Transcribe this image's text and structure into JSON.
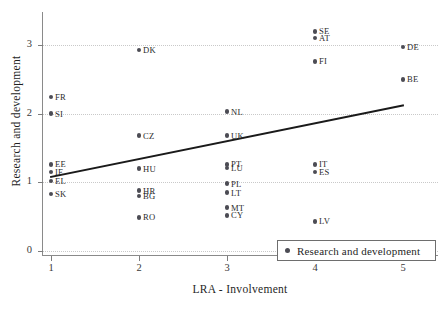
{
  "chart_data": {
    "type": "scatter",
    "title": "",
    "xlabel": "LRA - Involvement",
    "ylabel": "Research and development",
    "xlim": [
      0.5,
      5.5
    ],
    "ylim": [
      -0.1,
      3.35
    ],
    "xticks": [
      "1",
      "2",
      "3",
      "4",
      "5"
    ],
    "xtick_values": [
      1,
      2,
      3,
      4,
      5
    ],
    "yticks": [
      "0",
      "1",
      "2",
      "3"
    ],
    "ytick_values": [
      0,
      1,
      2,
      3
    ],
    "grid": "horizontal-dotted",
    "legend_position": "bottom-right",
    "series": [
      {
        "name": "Research and development",
        "marker": "circle",
        "color": "#4c4c54",
        "points": [
          {
            "label": "SE",
            "x": 4,
            "y": 3.2
          },
          {
            "label": "AT",
            "x": 4,
            "y": 3.1
          },
          {
            "label": "DE",
            "x": 5,
            "y": 2.97
          },
          {
            "label": "DK",
            "x": 2,
            "y": 2.93
          },
          {
            "label": "FI",
            "x": 4,
            "y": 2.76
          },
          {
            "label": "BE",
            "x": 5,
            "y": 2.5
          },
          {
            "label": "FR",
            "x": 1,
            "y": 2.24
          },
          {
            "label": "NL",
            "x": 3,
            "y": 2.03
          },
          {
            "label": "SI",
            "x": 1,
            "y": 2.0
          },
          {
            "label": "CZ",
            "x": 2,
            "y": 1.68
          },
          {
            "label": "UK",
            "x": 3,
            "y": 1.68
          },
          {
            "label": "EE",
            "x": 1,
            "y": 1.26
          },
          {
            "label": "PT",
            "x": 3,
            "y": 1.26
          },
          {
            "label": "IT",
            "x": 4,
            "y": 1.26
          },
          {
            "label": "LU",
            "x": 3,
            "y": 1.21
          },
          {
            "label": "HU",
            "x": 2,
            "y": 1.2
          },
          {
            "label": "IE",
            "x": 1,
            "y": 1.15
          },
          {
            "label": "ES",
            "x": 4,
            "y": 1.15
          },
          {
            "label": "EL",
            "x": 1,
            "y": 1.02
          },
          {
            "label": "PL",
            "x": 3,
            "y": 0.98
          },
          {
            "label": "HR",
            "x": 2,
            "y": 0.88
          },
          {
            "label": "LT",
            "x": 3,
            "y": 0.85
          },
          {
            "label": "SK",
            "x": 1,
            "y": 0.83
          },
          {
            "label": "BG",
            "x": 2,
            "y": 0.8
          },
          {
            "label": "MT",
            "x": 3,
            "y": 0.63
          },
          {
            "label": "CY",
            "x": 3,
            "y": 0.52
          },
          {
            "label": "RO",
            "x": 2,
            "y": 0.49
          },
          {
            "label": "LV",
            "x": 4,
            "y": 0.43
          }
        ]
      }
    ],
    "trendline": {
      "x_start": 1.0,
      "y_start": 1.08,
      "x_end": 5.0,
      "y_end": 2.12,
      "color": "#1a1a1a",
      "width": 1.8
    }
  },
  "legend": {
    "entries": [
      {
        "label": "Research and development"
      }
    ]
  }
}
